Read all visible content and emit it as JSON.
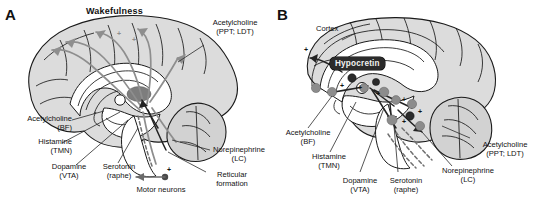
{
  "figure": {
    "type": "two-panel sagittal brain diagram",
    "panels": [
      {
        "letter": "A",
        "title": "Wakefulness",
        "labels": [
          {
            "name": "acetylcholine-ppt-ldt",
            "line1": "Acetylcholine",
            "line2": "(PPT; LDT)"
          },
          {
            "name": "acetylcholine-bf",
            "line1": "Acetylcholine",
            "line2": "(BF)"
          },
          {
            "name": "histamine-tmn",
            "line1": "Histamine",
            "line2": "(TMN)"
          },
          {
            "name": "dopamine-vta",
            "line1": "Dopamine",
            "line2": "(VTA)"
          },
          {
            "name": "serotonin-raphe",
            "line1": "Serotonin",
            "line2": "(raphe)"
          },
          {
            "name": "norepinephrine-lc",
            "line1": "Norepinephrine",
            "line2": "(LC)"
          },
          {
            "name": "reticular-formation",
            "line1": "Reticular",
            "line2": "formation"
          },
          {
            "name": "motor-neurons",
            "line1": "Motor neurons",
            "line2": ""
          }
        ]
      },
      {
        "letter": "B",
        "title": "",
        "badge": "Hypocretin",
        "labels": [
          {
            "name": "cortex",
            "line1": "Cortex",
            "line2": ""
          },
          {
            "name": "acetylcholine-bf",
            "line1": "Acetylcholine",
            "line2": "(BF)"
          },
          {
            "name": "histamine-tmn",
            "line1": "Histamine",
            "line2": "(TMN)"
          },
          {
            "name": "dopamine-vta",
            "line1": "Dopamine",
            "line2": "(VTA)"
          },
          {
            "name": "serotonin-raphe",
            "line1": "Serotonin",
            "line2": "(raphe)"
          },
          {
            "name": "norepinephrine-lc",
            "line1": "Norepinephrine",
            "line2": "(LC)"
          },
          {
            "name": "acetylcholine-ppt-ldt",
            "line1": "Acetylcholine",
            "line2": "(PPT; LDT)"
          }
        ]
      }
    ],
    "symbols": {
      "excitatory": "+"
    },
    "colors": {
      "background": "#ffffff",
      "brain_fill": "#dcdcdc",
      "outline": "#1a1a1a",
      "tract_gray": "#8e8e8e",
      "tract_dark": "#232323",
      "badge_bg": "#2b2b2b",
      "badge_text": "#f2f2f2",
      "nucleus_gray": "#8c8c8c",
      "nucleus_dark": "#2b2b2b"
    }
  }
}
